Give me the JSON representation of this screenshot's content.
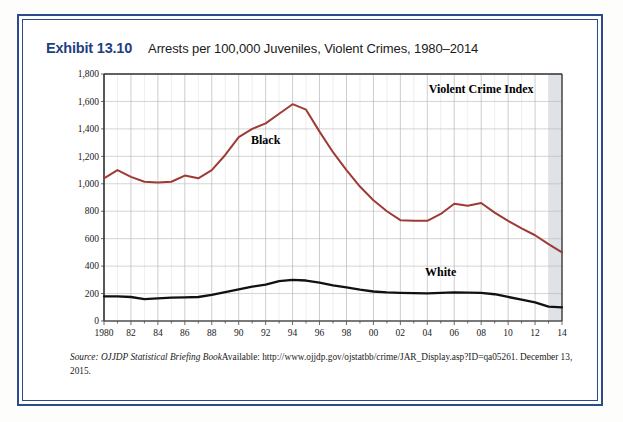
{
  "exhibit": {
    "number": "Exhibit 13.10",
    "title": "Arrests per 100,000 Juveniles, Violent Crimes, 1980–2014"
  },
  "source": {
    "prefix": "Source:",
    "publication": "OJJDP Statistical Briefing Book",
    "available_label": "Available:",
    "url": "http://www.ojjdp.gov/ojstatbb/crime/JAR_Display.asp?ID=qa05261.",
    "accessed": "December 13, 2015."
  },
  "colors": {
    "frame_blue": "#2b4b8c",
    "exhibit_blue": "#1f3f82",
    "black_series": "#9e3b34",
    "white_series": "#111111",
    "grid_minor": "#d8d8d8",
    "grid_major": "#b8b8b8",
    "axis": "#444444",
    "shaded_band": "#d9dde3"
  },
  "chart_data": {
    "type": "line",
    "title": "Arrests per 100,000 Juveniles, Violent Crimes, 1980–2014",
    "annotation": "Violent Crime Index",
    "xlabel": "",
    "ylabel": "",
    "ylim": [
      0,
      1800
    ],
    "ytick_step": 200,
    "ytick_labels": [
      "0",
      "200",
      "400",
      "600",
      "800",
      "1,000",
      "1,200",
      "1,400",
      "1,600",
      "1,800"
    ],
    "xlim": [
      1980,
      2014
    ],
    "xtick_labels": [
      "1980",
      "82",
      "84",
      "86",
      "88",
      "90",
      "92",
      "94",
      "96",
      "98",
      "00",
      "02",
      "04",
      "06",
      "08",
      "10",
      "12",
      "14"
    ],
    "xtick_years": [
      1980,
      1982,
      1984,
      1986,
      1988,
      1990,
      1992,
      1994,
      1996,
      1998,
      2000,
      2002,
      2004,
      2006,
      2008,
      2010,
      2012,
      2014
    ],
    "grid": true,
    "legend_position": "inline-labels",
    "shaded_region": {
      "from": 2013,
      "to": 2014
    },
    "x": [
      1980,
      1981,
      1982,
      1983,
      1984,
      1985,
      1986,
      1987,
      1988,
      1989,
      1990,
      1991,
      1992,
      1993,
      1994,
      1995,
      1996,
      1997,
      1998,
      1999,
      2000,
      2001,
      2002,
      2003,
      2004,
      2005,
      2006,
      2007,
      2008,
      2009,
      2010,
      2011,
      2012,
      2013,
      2014
    ],
    "series": [
      {
        "name": "Black",
        "color": "#9e3b34",
        "label_x": 1992,
        "label_y": 1290,
        "values": [
          1040,
          1100,
          1050,
          1015,
          1010,
          1015,
          1060,
          1040,
          1100,
          1210,
          1340,
          1400,
          1440,
          1510,
          1580,
          1540,
          1380,
          1230,
          1100,
          980,
          880,
          800,
          735,
          730,
          730,
          780,
          855,
          840,
          860,
          790,
          730,
          675,
          625,
          560,
          500
        ]
      },
      {
        "name": "White",
        "color": "#111111",
        "label_x": 2005,
        "label_y": 330,
        "values": [
          180,
          180,
          175,
          160,
          165,
          170,
          172,
          175,
          190,
          210,
          230,
          250,
          265,
          290,
          300,
          295,
          280,
          260,
          245,
          228,
          215,
          208,
          205,
          203,
          202,
          205,
          208,
          207,
          205,
          195,
          175,
          155,
          135,
          105,
          100
        ]
      }
    ]
  }
}
